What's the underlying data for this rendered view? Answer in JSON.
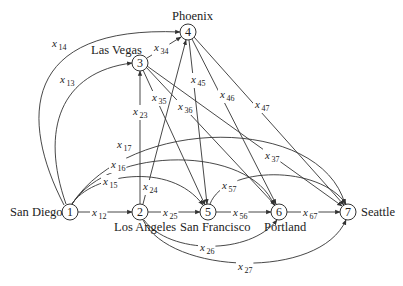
{
  "diagram": {
    "type": "directed network",
    "nodes": [
      {
        "id": "1",
        "label": "1",
        "city": "San Diego",
        "x": 70,
        "y": 212,
        "city_x": 10,
        "city_y": 216,
        "anchor": "start"
      },
      {
        "id": "2",
        "label": "2",
        "city": "Los Angeles",
        "x": 140,
        "y": 212,
        "city_x": 114,
        "city_y": 231,
        "anchor": "start"
      },
      {
        "id": "3",
        "label": "3",
        "city": "Las Vegas",
        "x": 140,
        "y": 63,
        "city_x": 91,
        "city_y": 54,
        "anchor": "start"
      },
      {
        "id": "4",
        "label": "4",
        "city": "Phoenix",
        "x": 188,
        "y": 32,
        "city_x": 172,
        "city_y": 20,
        "anchor": "start"
      },
      {
        "id": "5",
        "label": "5",
        "city": "San Francisco",
        "x": 208,
        "y": 212,
        "city_x": 180,
        "city_y": 231,
        "anchor": "start"
      },
      {
        "id": "6",
        "label": "6",
        "city": "Portland",
        "x": 279,
        "y": 212,
        "city_x": 264,
        "city_y": 231,
        "anchor": "start"
      },
      {
        "id": "7",
        "label": "7",
        "city": "Seattle",
        "x": 348,
        "y": 212,
        "city_x": 361,
        "city_y": 216,
        "anchor": "start"
      }
    ],
    "edges": [
      {
        "id": "x12",
        "from": "1",
        "to": "2",
        "var": "x",
        "sub": "12",
        "lx": 92,
        "ly": 216,
        "path": "M78,212 L132,212"
      },
      {
        "id": "x13",
        "from": "1",
        "to": "3",
        "var": "x",
        "sub": "13",
        "lx": 60,
        "ly": 83,
        "path": "M66,204 C40,130 60,72 132,63"
      },
      {
        "id": "x14",
        "from": "1",
        "to": "4",
        "var": "x",
        "sub": "14",
        "lx": 52,
        "ly": 47,
        "path": "M64,205 C20,120 20,25 180,32"
      },
      {
        "id": "x15",
        "from": "1",
        "to": "5",
        "var": "x",
        "sub": "15",
        "lx": 103,
        "ly": 185,
        "path": "M72,204 C90,175 170,160 203,205"
      },
      {
        "id": "x16",
        "from": "1",
        "to": "6",
        "var": "x",
        "sub": "16",
        "lx": 111,
        "ly": 168,
        "path": "M72,204 C110,145 250,145 274,205"
      },
      {
        "id": "x17",
        "from": "1",
        "to": "7",
        "var": "x",
        "sub": "17",
        "lx": 117,
        "ly": 148,
        "path": "M72,204 C130,115 320,115 345,204"
      },
      {
        "id": "x23",
        "from": "2",
        "to": "3",
        "var": "x",
        "sub": "23",
        "lx": 133,
        "ly": 115,
        "path": "M140,204 L140,71"
      },
      {
        "id": "x24",
        "from": "2",
        "to": "4",
        "var": "x",
        "sub": "24",
        "lx": 143,
        "ly": 190,
        "path": "M143,204 L186,40"
      },
      {
        "id": "x25",
        "from": "2",
        "to": "5",
        "var": "x",
        "sub": "25",
        "lx": 163,
        "ly": 216,
        "path": "M148,212 L200,212"
      },
      {
        "id": "x26",
        "from": "2",
        "to": "6",
        "var": "x",
        "sub": "26",
        "lx": 200,
        "ly": 251,
        "path": "M144,220 C170,255 250,255 277,220"
      },
      {
        "id": "x27",
        "from": "2",
        "to": "7",
        "var": "x",
        "sub": "27",
        "lx": 238,
        "ly": 270,
        "path": "M143,220 C170,275 320,280 346,220"
      },
      {
        "id": "x34",
        "from": "3",
        "to": "4",
        "var": "x",
        "sub": "34",
        "lx": 154,
        "ly": 51,
        "path": "M147,58 L181,37"
      },
      {
        "id": "x35",
        "from": "3",
        "to": "5",
        "var": "x",
        "sub": "35",
        "lx": 152,
        "ly": 101,
        "path": "M143,70 L205,205"
      },
      {
        "id": "x36",
        "from": "3",
        "to": "6",
        "var": "x",
        "sub": "36",
        "lx": 178,
        "ly": 110,
        "path": "M146,67 L275,205"
      },
      {
        "id": "x37",
        "from": "3",
        "to": "7",
        "var": "x",
        "sub": "37",
        "lx": 265,
        "ly": 159,
        "path": "M147,66 L342,206"
      },
      {
        "id": "x45",
        "from": "4",
        "to": "5",
        "var": "x",
        "sub": "45",
        "lx": 191,
        "ly": 83,
        "path": "M189,40 L207,204"
      },
      {
        "id": "x46",
        "from": "4",
        "to": "6",
        "var": "x",
        "sub": "46",
        "lx": 220,
        "ly": 98,
        "path": "M192,39 L276,204"
      },
      {
        "id": "x47",
        "from": "4",
        "to": "7",
        "var": "x",
        "sub": "47",
        "lx": 255,
        "ly": 108,
        "path": "M194,37 L344,205"
      },
      {
        "id": "x56",
        "from": "5",
        "to": "6",
        "var": "x",
        "sub": "56",
        "lx": 233,
        "ly": 216,
        "path": "M216,212 L271,212"
      },
      {
        "id": "x57",
        "from": "5",
        "to": "7",
        "var": "x",
        "sub": "57",
        "lx": 222,
        "ly": 189,
        "path": "M210,204 C225,165 320,165 346,204"
      },
      {
        "id": "x67",
        "from": "6",
        "to": "7",
        "var": "x",
        "sub": "67",
        "lx": 303,
        "ly": 216,
        "path": "M287,212 L340,212"
      }
    ]
  }
}
